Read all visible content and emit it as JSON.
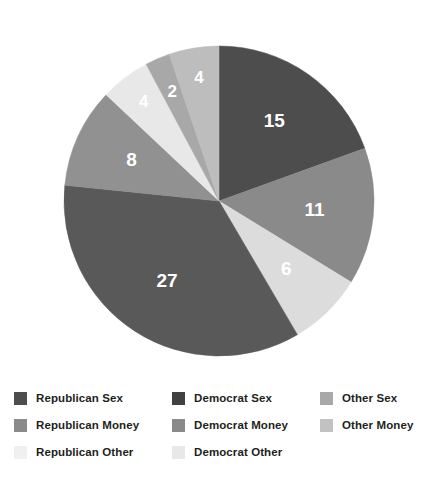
{
  "chart_data": {
    "type": "pie",
    "title": "",
    "subtitle": "",
    "xlabel": "",
    "ylabel": "",
    "total": 77,
    "start_angle_deg": 0,
    "direction": "clockwise",
    "legend_position": "bottom",
    "grid": false,
    "labels_inside_slices": true,
    "categories": [
      "Republican Sex",
      "Republican Money",
      "Republican Other",
      "Democrat Sex",
      "Democrat Money",
      "Democrat Other",
      "Other Sex",
      "Other Money"
    ],
    "values": [
      15,
      11,
      6,
      27,
      8,
      4,
      2,
      4
    ],
    "colors": [
      "#4d4d4d",
      "#8a8a8a",
      "#dcdcdc",
      "#595959",
      "#919191",
      "#e8e8e8",
      "#a8a8a8",
      "#bdbdbd"
    ],
    "slices": [
      {
        "label": "Republican Sex",
        "value": 15,
        "color": "#4d4d4d",
        "data_label": "15"
      },
      {
        "label": "Republican Money",
        "value": 11,
        "color": "#8a8a8a",
        "data_label": "11"
      },
      {
        "label": "Republican Other",
        "value": 6,
        "color": "#dcdcdc",
        "data_label": "6"
      },
      {
        "label": "Democrat Sex",
        "value": 27,
        "color": "#595959",
        "data_label": "27"
      },
      {
        "label": "Democrat Money",
        "value": 8,
        "color": "#919191",
        "data_label": "8"
      },
      {
        "label": "Democrat Other",
        "value": 4,
        "color": "#e8e8e8",
        "data_label": "4"
      },
      {
        "label": "Other Sex",
        "value": 2,
        "color": "#a8a8a8",
        "data_label": "2"
      },
      {
        "label": "Other Money",
        "value": 4,
        "color": "#bdbdbd",
        "data_label": "4"
      }
    ]
  },
  "legend": {
    "columns": [
      {
        "items": [
          {
            "label": "Republican Sex",
            "color": "#4d4d4d"
          },
          {
            "label": "Republican  Money",
            "color": "#8a8a8a"
          },
          {
            "label": "Republican Other",
            "color": "#f0f0f0"
          }
        ]
      },
      {
        "items": [
          {
            "label": "Democrat Sex",
            "color": "#414141"
          },
          {
            "label": "Democrat Money",
            "color": "#8a8a8a"
          },
          {
            "label": "Democrat Other",
            "color": "#e8e8e8"
          }
        ]
      },
      {
        "items": [
          {
            "label": "Other  Sex",
            "color": "#a8a8a8"
          },
          {
            "label": "Other  Money",
            "color": "#c2c2c2"
          }
        ]
      }
    ]
  },
  "geometry": {
    "center_x": 219,
    "center_y": 201,
    "radius": 155,
    "label_radius_fraction": 0.62
  }
}
